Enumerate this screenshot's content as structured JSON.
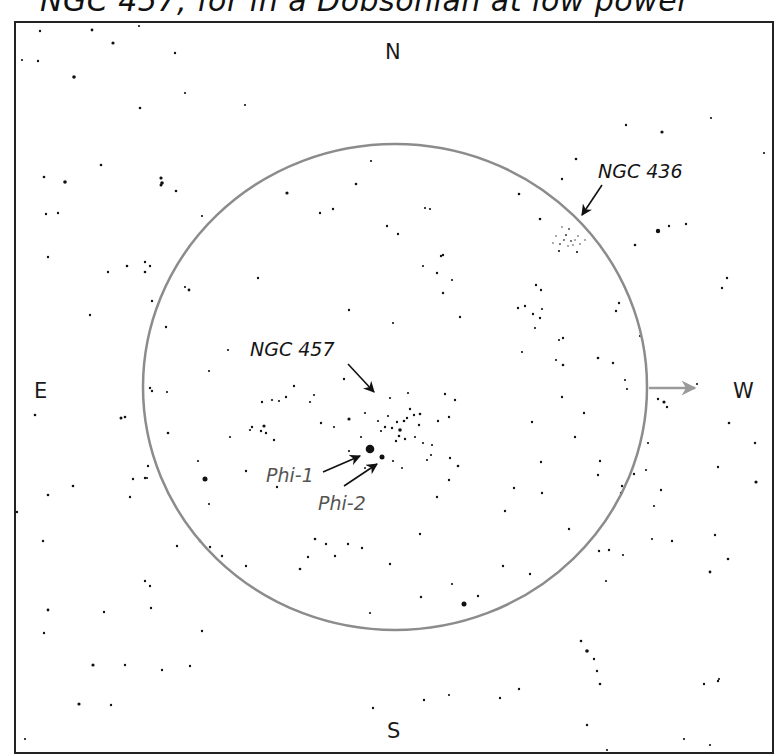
{
  "caption": "NGC 457, for in a Dobsonian at low power",
  "compass": {
    "north": "N",
    "south": "S",
    "east": "E",
    "west": "W"
  },
  "colors": {
    "frame": "#222222",
    "fov_circle": "#8c8c8c",
    "drift_arrow": "#9a9a9a",
    "star": "#111111",
    "star_label": "#555555"
  },
  "field_of_view": {
    "cx": 395,
    "cy": 387,
    "rx": 252,
    "ry": 243
  },
  "labels": {
    "ngc457": {
      "text": "NGC 457",
      "x": 250,
      "y": 356
    },
    "ngc436": {
      "text": "NGC 436",
      "x": 598,
      "y": 178
    },
    "phi1": {
      "text": "Phi-1",
      "x": 266,
      "y": 482
    },
    "phi2": {
      "text": "Phi-2",
      "x": 318,
      "y": 510
    }
  },
  "arrows": [
    {
      "name": "ngc457-pointer",
      "x1": 348,
      "y1": 364,
      "x2": 374,
      "y2": 392
    },
    {
      "name": "ngc436-pointer",
      "x1": 602,
      "y1": 185,
      "x2": 582,
      "y2": 215
    },
    {
      "name": "phi1-pointer",
      "x1": 323,
      "y1": 472,
      "x2": 360,
      "y2": 456
    },
    {
      "name": "phi2-pointer",
      "x1": 344,
      "y1": 486,
      "x2": 377,
      "y2": 464
    }
  ],
  "drift_arrow": {
    "x1": 649,
    "y1": 388,
    "x2": 695,
    "y2": 388,
    "direction": "W"
  },
  "stars": [
    [
      40,
      31,
      1.2
    ],
    [
      92,
      30,
      1.4
    ],
    [
      139,
      26,
      1.1
    ],
    [
      113,
      43,
      1.6
    ],
    [
      22,
      60,
      1.1
    ],
    [
      38,
      61,
      1.2
    ],
    [
      74,
      77,
      1.8
    ],
    [
      175,
      53,
      1.2
    ],
    [
      140,
      108,
      1.3
    ],
    [
      185,
      93,
      1.1
    ],
    [
      161,
      178,
      1.5
    ],
    [
      161,
      185,
      1.5
    ],
    [
      44,
      177,
      1.3
    ],
    [
      65,
      182,
      1.8
    ],
    [
      101,
      165,
      1.3
    ],
    [
      161,
      178,
      1.3
    ],
    [
      162,
      183,
      1.8
    ],
    [
      176,
      191,
      1.3
    ],
    [
      58,
      213,
      1.2
    ],
    [
      46,
      214,
      1.2
    ],
    [
      245,
      105,
      1.1
    ],
    [
      287,
      193,
      1.6
    ],
    [
      356,
      184,
      1.3
    ],
    [
      371,
      161,
      1.1
    ],
    [
      333,
      209,
      1.2
    ],
    [
      320,
      213,
      1.2
    ],
    [
      425,
      208,
      1.1
    ],
    [
      430,
      209,
      1.1
    ],
    [
      398,
      234,
      1.2
    ],
    [
      441,
      256,
      1.2
    ],
    [
      387,
      226,
      1.2
    ],
    [
      258,
      278,
      1.2
    ],
    [
      349,
      310,
      1.2
    ],
    [
      443,
      255,
      1.2
    ],
    [
      452,
      280,
      1.1
    ],
    [
      423,
      266,
      1.1
    ],
    [
      519,
      194,
      1.3
    ],
    [
      540,
      219,
      1.3
    ],
    [
      562,
      179,
      1.2
    ],
    [
      576,
      159,
      1.3
    ],
    [
      577,
      252,
      1.1
    ],
    [
      559,
      251,
      1.1
    ],
    [
      536,
      285,
      1.2
    ],
    [
      525,
      306,
      1.2
    ],
    [
      541,
      290,
      1.2
    ],
    [
      518,
      308,
      1.2
    ],
    [
      542,
      309,
      1.1
    ],
    [
      533,
      314,
      1.2
    ],
    [
      540,
      318,
      1.2
    ],
    [
      559,
      340,
      1.1
    ],
    [
      522,
      352,
      1.1
    ],
    [
      556,
      360,
      1.1
    ],
    [
      563,
      365,
      1.3
    ],
    [
      598,
      358,
      1.3
    ],
    [
      619,
      303,
      1.2
    ],
    [
      662,
      132,
      1.6
    ],
    [
      626,
      125,
      1.2
    ],
    [
      669,
      226,
      1.2
    ],
    [
      686,
      224,
      1.2
    ],
    [
      658,
      231,
      2.2
    ],
    [
      635,
      245,
      1.3
    ],
    [
      711,
      118,
      1.1
    ],
    [
      764,
      153,
      1.1
    ],
    [
      727,
      278,
      1.2
    ],
    [
      722,
      288,
      1.2
    ],
    [
      697,
      384,
      1.1
    ],
    [
      648,
      443,
      1.1
    ],
    [
      646,
      470,
      1.1
    ],
    [
      654,
      506,
      1.1
    ],
    [
      652,
      539,
      1.1
    ],
    [
      729,
      423,
      1.3
    ],
    [
      755,
      443,
      1.2
    ],
    [
      756,
      482,
      1.6
    ],
    [
      661,
      490,
      1.2
    ],
    [
      718,
      467,
      1.2
    ],
    [
      715,
      535,
      1.2
    ],
    [
      672,
      541,
      1.2
    ],
    [
      728,
      559,
      1.3
    ],
    [
      710,
      572,
      1.4
    ],
    [
      606,
      581,
      1.1
    ],
    [
      623,
      555,
      1.1
    ],
    [
      581,
      641,
      1.3
    ],
    [
      587,
      651,
      1.8
    ],
    [
      594,
      659,
      1.2
    ],
    [
      597,
      671,
      1.2
    ],
    [
      600,
      684,
      1.3
    ],
    [
      587,
      725,
      1.2
    ],
    [
      607,
      750,
      1.1
    ],
    [
      718,
      681,
      1.2
    ],
    [
      719,
      679,
      1.1
    ],
    [
      704,
      684,
      1.2
    ],
    [
      684,
      739,
      1.1
    ],
    [
      710,
      745,
      1.1
    ],
    [
      452,
      584,
      1.1
    ],
    [
      464,
      604,
      2.5
    ],
    [
      478,
      596,
      1.2
    ],
    [
      503,
      566,
      1.2
    ],
    [
      530,
      574,
      1.2
    ],
    [
      421,
      597,
      1.2
    ],
    [
      370,
      613,
      1.1
    ],
    [
      300,
      569,
      1.3
    ],
    [
      315,
      539,
      1.3
    ],
    [
      222,
      556,
      1.2
    ],
    [
      210,
      547,
      1.2
    ],
    [
      177,
      546,
      1.2
    ],
    [
      200,
      541,
      1.2
    ],
    [
      246,
      566,
      1.2
    ],
    [
      145,
      581,
      1.2
    ],
    [
      151,
      608,
      1.2
    ],
    [
      104,
      612,
      1.2
    ],
    [
      93,
      665,
      1.6
    ],
    [
      125,
      665,
      1.2
    ],
    [
      162,
      670,
      1.2
    ],
    [
      44,
      633,
      1.2
    ],
    [
      48,
      610,
      1.4
    ],
    [
      79,
      704,
      1.6
    ],
    [
      111,
      705,
      1.2
    ],
    [
      190,
      666,
      1.2
    ],
    [
      202,
      631,
      1.2
    ],
    [
      25,
      739,
      1.1
    ],
    [
      373,
      708,
      1.2
    ],
    [
      424,
      700,
      1.2
    ],
    [
      449,
      695,
      1.1
    ],
    [
      500,
      698,
      1.2
    ],
    [
      519,
      689,
      1.2
    ],
    [
      35,
      415,
      1.3
    ],
    [
      73,
      486,
      1.3
    ],
    [
      48,
      495,
      1.3
    ],
    [
      121,
      418,
      1.5
    ],
    [
      125,
      417,
      1.3
    ],
    [
      133,
      479,
      1.2
    ],
    [
      145,
      478,
      1.2
    ],
    [
      17,
      512,
      1.2
    ],
    [
      43,
      541,
      1.2
    ],
    [
      150,
      586,
      1.2
    ],
    [
      205,
      479,
      2.5
    ],
    [
      209,
      504,
      1.1
    ],
    [
      198,
      461,
      1.1
    ],
    [
      264,
      426,
      1.6
    ],
    [
      266,
      433,
      1.2
    ],
    [
      261,
      431,
      1.2
    ],
    [
      250,
      430,
      1.1
    ],
    [
      230,
      437,
      1.1
    ],
    [
      274,
      440,
      1.2
    ],
    [
      246,
      471,
      1.2
    ],
    [
      279,
      401,
      1.1
    ],
    [
      272,
      400,
      1.1
    ],
    [
      262,
      402,
      1.2
    ],
    [
      48,
      257,
      1.2
    ],
    [
      108,
      272,
      1.2
    ],
    [
      127,
      266,
      1.3
    ],
    [
      145,
      272,
      1.3
    ],
    [
      150,
      266,
      1.2
    ],
    [
      145,
      262,
      1.2
    ],
    [
      189,
      290,
      1.4
    ],
    [
      202,
      216,
      1.1
    ],
    [
      185,
      287,
      1.1
    ],
    [
      90,
      315,
      1.2
    ],
    [
      152,
      301,
      1.2
    ],
    [
      166,
      327,
      1.2
    ],
    [
      167,
      392,
      1.1
    ],
    [
      150,
      388,
      1.2
    ],
    [
      152,
      391,
      1.2
    ],
    [
      168,
      433,
      1.3
    ],
    [
      148,
      466,
      1.2
    ],
    [
      147,
      478,
      1.1
    ],
    [
      130,
      497,
      1.2
    ],
    [
      228,
      350,
      1.1
    ],
    [
      209,
      371,
      1.1
    ],
    [
      349,
      419,
      1.6
    ],
    [
      370,
      449,
      4.3
    ],
    [
      382,
      457,
      2.5
    ],
    [
      400,
      430,
      1.8
    ],
    [
      404,
      421,
      1.3
    ],
    [
      407,
      418,
      1.2
    ],
    [
      410,
      409,
      1.2
    ],
    [
      397,
      422,
      1.2
    ],
    [
      392,
      428,
      1.2
    ],
    [
      385,
      427,
      1.2
    ],
    [
      399,
      436,
      1.3
    ],
    [
      396,
      441,
      1.2
    ],
    [
      405,
      439,
      1.2
    ],
    [
      415,
      437,
      1.1
    ],
    [
      419,
      425,
      1.2
    ],
    [
      414,
      415,
      1.2
    ],
    [
      420,
      414,
      1.3
    ],
    [
      381,
      431,
      1.1
    ],
    [
      378,
      421,
      1.1
    ],
    [
      423,
      443,
      1.1
    ],
    [
      432,
      445,
      1.1
    ],
    [
      431,
      455,
      1.1
    ],
    [
      427,
      460,
      1.1
    ],
    [
      408,
      393,
      1.1
    ],
    [
      390,
      398,
      1.1
    ],
    [
      388,
      416,
      1.1
    ],
    [
      365,
      413,
      1.1
    ],
    [
      349,
      451,
      1.1
    ],
    [
      361,
      437,
      1.1
    ],
    [
      393,
      461,
      1.1
    ],
    [
      402,
      468,
      1.0
    ],
    [
      365,
      468,
      1.0
    ],
    [
      445,
      394,
      1.2
    ],
    [
      455,
      400,
      1.2
    ],
    [
      438,
      421,
      1.2
    ],
    [
      449,
      417,
      1.2
    ],
    [
      450,
      458,
      1.2
    ],
    [
      449,
      480,
      1.2
    ],
    [
      458,
      466,
      1.3
    ],
    [
      437,
      497,
      1.2
    ],
    [
      420,
      534,
      1.2
    ],
    [
      390,
      564,
      1.2
    ],
    [
      362,
      548,
      1.2
    ],
    [
      335,
      556,
      1.2
    ],
    [
      326,
      544,
      1.2
    ],
    [
      348,
      544,
      1.2
    ],
    [
      308,
      557,
      1.2
    ],
    [
      277,
      487,
      1.2
    ],
    [
      252,
      427,
      1.2
    ],
    [
      310,
      402,
      1.1
    ],
    [
      286,
      397,
      1.2
    ],
    [
      314,
      395,
      1.1
    ],
    [
      334,
      427,
      1.1
    ],
    [
      321,
      423,
      1.2
    ],
    [
      294,
      386,
      1.2
    ],
    [
      344,
      379,
      1.2
    ],
    [
      393,
      323,
      1.1
    ],
    [
      437,
      273,
      1.2
    ],
    [
      443,
      293,
      1.2
    ],
    [
      460,
      317,
      1.2
    ],
    [
      535,
      328,
      1.1
    ],
    [
      562,
      397,
      1.2
    ],
    [
      563,
      338,
      1.2
    ],
    [
      584,
      413,
      1.2
    ],
    [
      613,
      363,
      1.2
    ],
    [
      625,
      380,
      1.1
    ],
    [
      634,
      474,
      1.2
    ],
    [
      569,
      529,
      1.2
    ],
    [
      541,
      462,
      1.2
    ],
    [
      598,
      475,
      1.2
    ],
    [
      621,
      493,
      1.2
    ],
    [
      542,
      493,
      1.2
    ],
    [
      609,
      550,
      1.2
    ],
    [
      599,
      551,
      1.2
    ],
    [
      514,
      488,
      1.2
    ],
    [
      505,
      511,
      1.2
    ],
    [
      622,
      486,
      1.2
    ],
    [
      532,
      422,
      1.2
    ],
    [
      575,
      437,
      1.2
    ],
    [
      600,
      461,
      1.2
    ],
    [
      627,
      389,
      1.1
    ],
    [
      640,
      336,
      1.1
    ],
    [
      664,
      402,
      1.6
    ],
    [
      667,
      407,
      1.2
    ],
    [
      658,
      399,
      1.2
    ],
    [
      616,
      311,
      1.2
    ]
  ],
  "cluster_ngc436": [
    [
      566,
      235,
      1.4
    ],
    [
      569,
      229,
      1.2
    ],
    [
      564,
      240,
      1.1
    ],
    [
      571,
      241,
      1.2
    ],
    [
      560,
      244,
      1.1
    ],
    [
      575,
      240,
      1.0
    ],
    [
      578,
      236,
      1.0
    ],
    [
      556,
      236,
      1.0
    ],
    [
      562,
      227,
      1.0
    ],
    [
      573,
      245,
      1.0
    ],
    [
      580,
      244,
      1.0
    ],
    [
      568,
      246,
      1.0
    ],
    [
      585,
      240,
      1.0
    ],
    [
      553,
      243,
      1.0
    ]
  ]
}
